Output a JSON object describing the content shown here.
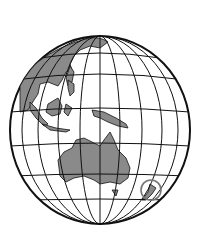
{
  "image": {
    "subject": "Globe centered on Australia and Oceania",
    "caption": "",
    "colors": {
      "background": "#ffffff",
      "land": "#8a8a8a",
      "lines": "#111111",
      "highlight_circle": "#777777"
    },
    "highlight": "circle around New Zealand"
  }
}
